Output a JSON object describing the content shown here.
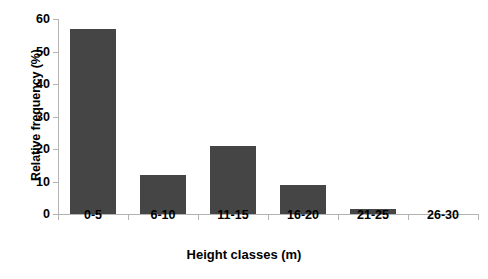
{
  "chart_data": {
    "type": "bar",
    "title": "",
    "subtitle": "",
    "categories": [
      "0-5",
      "6-10",
      "11-15",
      "16-20",
      "21-25",
      "26-30"
    ],
    "values": [
      57,
      12,
      21,
      9,
      1.5,
      0
    ],
    "xlabel": "Height classes (m)",
    "ylabel": "Relative frequency (%)",
    "ylim": [
      0,
      60
    ],
    "ytick_labels": [
      "0",
      "10",
      "20",
      "30",
      "40",
      "50",
      "60"
    ],
    "ytick_values": [
      0,
      10,
      20,
      30,
      40,
      50,
      60
    ],
    "grid": false,
    "legend": false,
    "legend_position": "none",
    "bar_color": "#454545",
    "axis_color": "#b3b3b3",
    "text_color": "#000000",
    "background_color": "#ffffff"
  }
}
